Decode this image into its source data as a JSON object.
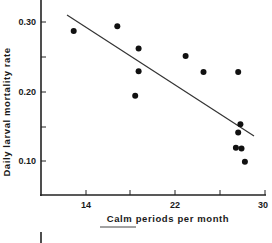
{
  "chart_data": {
    "type": "scatter",
    "title": "",
    "xlabel": "Calm periods per month",
    "ylabel": "Daily larval mortality rate",
    "xlim": [
      10,
      30
    ],
    "ylim": [
      0.05,
      0.32
    ],
    "x_ticks": [
      14,
      18,
      22,
      26,
      30
    ],
    "x_tick_labels": [
      "14",
      "",
      "22",
      "",
      "30"
    ],
    "y_ticks": [
      0.1,
      0.15,
      0.2,
      0.25,
      0.3
    ],
    "y_tick_labels": [
      "0.10",
      "",
      "0.20",
      "",
      "0.30"
    ],
    "grid": false,
    "legend": null,
    "series": [
      {
        "name": "observations",
        "points": [
          {
            "x": 12.9,
            "y": 0.287
          },
          {
            "x": 16.8,
            "y": 0.294
          },
          {
            "x": 18.7,
            "y": 0.262
          },
          {
            "x": 18.7,
            "y": 0.229
          },
          {
            "x": 18.4,
            "y": 0.194
          },
          {
            "x": 22.9,
            "y": 0.251
          },
          {
            "x": 24.5,
            "y": 0.228
          },
          {
            "x": 27.6,
            "y": 0.228
          },
          {
            "x": 27.8,
            "y": 0.153
          },
          {
            "x": 27.6,
            "y": 0.141
          },
          {
            "x": 27.4,
            "y": 0.119
          },
          {
            "x": 27.9,
            "y": 0.118
          },
          {
            "x": 28.2,
            "y": 0.099
          }
        ]
      }
    ],
    "regression_line": {
      "x1": 12.2,
      "y1": 0.31,
      "x2": 28.9,
      "y2": 0.137
    }
  },
  "labels": {
    "xlabel": "Calm periods per month",
    "ylabel": "Daily larval mortality rate",
    "xtick_14": "14",
    "xtick_22": "22",
    "xtick_30": "30",
    "ytick_030": "0.30",
    "ytick_020": "0.20",
    "ytick_010": "0.10"
  }
}
